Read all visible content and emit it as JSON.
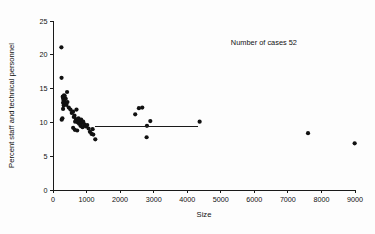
{
  "chart_data": {
    "type": "scatter",
    "title": "",
    "xlabel": "Size",
    "ylabel": "Percent staff and technical personnel",
    "xlim": [
      0,
      9000
    ],
    "ylim": [
      0,
      25
    ],
    "xticks": [
      0,
      1000,
      2000,
      3000,
      4000,
      5000,
      6000,
      7000,
      8000,
      9000
    ],
    "xticklabels": [
      "0",
      "1000",
      "2000",
      "3000",
      "4000",
      "5000",
      "6000",
      "7000",
      "8000",
      "9000"
    ],
    "yticks": [
      0,
      5,
      10,
      15,
      20,
      25
    ],
    "yticklabels": [
      "0",
      "5",
      "10",
      "15",
      "20",
      "25"
    ],
    "grid": false,
    "legend": null,
    "annotations": [
      {
        "text": "Number of cases 52",
        "x": 5300,
        "y": 21.4
      }
    ],
    "marker_color": "#111111",
    "marker_size": 2.1,
    "reference_line": {
      "label": "fitted asymptote",
      "y": 9.4,
      "x_start": 1250,
      "x_end": 4320,
      "color": "#1a1a1a"
    },
    "points": [
      {
        "x": 250,
        "y": 21.1
      },
      {
        "x": 255,
        "y": 16.6
      },
      {
        "x": 420,
        "y": 14.5
      },
      {
        "x": 330,
        "y": 14.0
      },
      {
        "x": 300,
        "y": 13.6
      },
      {
        "x": 310,
        "y": 13.3
      },
      {
        "x": 340,
        "y": 13.1
      },
      {
        "x": 300,
        "y": 12.9
      },
      {
        "x": 360,
        "y": 12.8
      },
      {
        "x": 320,
        "y": 12.5
      },
      {
        "x": 380,
        "y": 13.5
      },
      {
        "x": 350,
        "y": 13.9
      },
      {
        "x": 290,
        "y": 13.8
      },
      {
        "x": 430,
        "y": 13.0
      },
      {
        "x": 400,
        "y": 12.6
      },
      {
        "x": 300,
        "y": 12.0
      },
      {
        "x": 470,
        "y": 12.2
      },
      {
        "x": 520,
        "y": 11.9
      },
      {
        "x": 560,
        "y": 11.4
      },
      {
        "x": 600,
        "y": 11.6
      },
      {
        "x": 260,
        "y": 10.4
      },
      {
        "x": 280,
        "y": 10.6
      },
      {
        "x": 640,
        "y": 11.0
      },
      {
        "x": 700,
        "y": 11.9
      },
      {
        "x": 620,
        "y": 10.8
      },
      {
        "x": 680,
        "y": 10.5
      },
      {
        "x": 720,
        "y": 10.3
      },
      {
        "x": 760,
        "y": 10.6
      },
      {
        "x": 660,
        "y": 10.1
      },
      {
        "x": 740,
        "y": 10.0
      },
      {
        "x": 800,
        "y": 10.2
      },
      {
        "x": 780,
        "y": 9.8
      },
      {
        "x": 840,
        "y": 10.4
      },
      {
        "x": 860,
        "y": 9.9
      },
      {
        "x": 900,
        "y": 10.1
      },
      {
        "x": 820,
        "y": 9.5
      },
      {
        "x": 880,
        "y": 9.3
      },
      {
        "x": 940,
        "y": 9.7
      },
      {
        "x": 980,
        "y": 9.4
      },
      {
        "x": 600,
        "y": 9.2
      },
      {
        "x": 650,
        "y": 8.9
      },
      {
        "x": 720,
        "y": 8.8
      },
      {
        "x": 1020,
        "y": 9.6
      },
      {
        "x": 1060,
        "y": 9.1
      },
      {
        "x": 1100,
        "y": 8.6
      },
      {
        "x": 1150,
        "y": 8.3
      },
      {
        "x": 1200,
        "y": 8.2
      },
      {
        "x": 1260,
        "y": 7.5
      },
      {
        "x": 1180,
        "y": 9.0
      },
      {
        "x": 2450,
        "y": 11.2
      },
      {
        "x": 2560,
        "y": 12.1
      },
      {
        "x": 2660,
        "y": 12.2
      },
      {
        "x": 2800,
        "y": 9.5
      },
      {
        "x": 2900,
        "y": 10.2
      },
      {
        "x": 2790,
        "y": 7.8
      },
      {
        "x": 4370,
        "y": 10.1
      },
      {
        "x": 7600,
        "y": 8.4
      },
      {
        "x": 8990,
        "y": 6.9
      }
    ]
  },
  "figure": {
    "background_color": "#fdfdfd",
    "axis_color": "#1a1a1a"
  }
}
